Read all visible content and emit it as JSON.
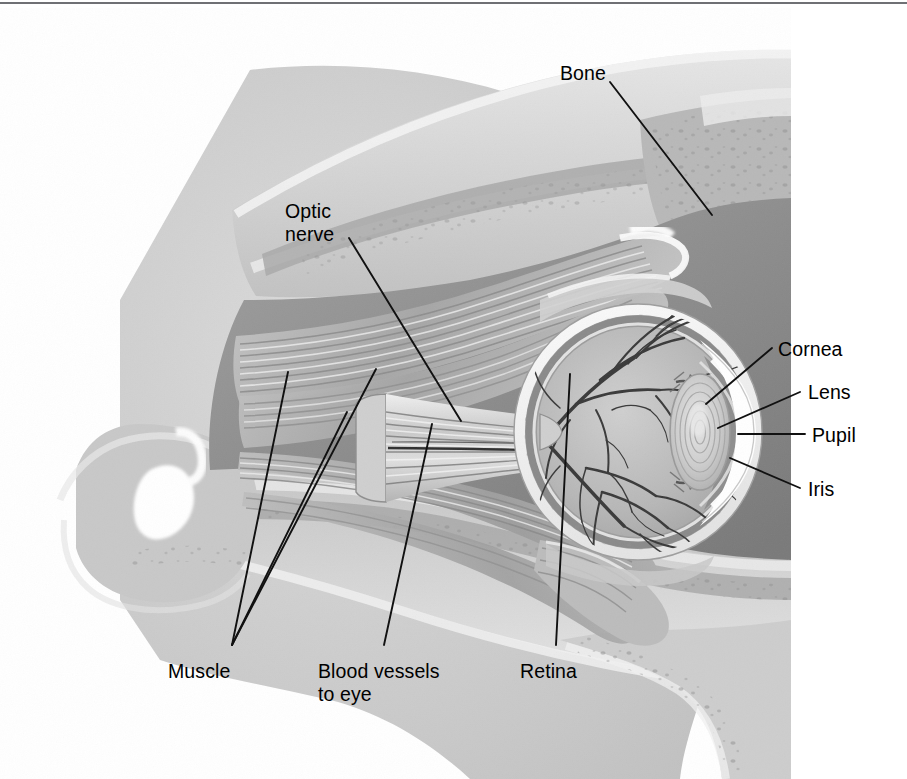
{
  "figure": {
    "kind": "anatomical-illustration",
    "palette": {
      "background": "#ffffff",
      "border_line": "#6f7074",
      "leader_line": "#111111",
      "label_text": "#000000",
      "bone_light": "#d8d8d8",
      "bone_mid": "#bdbdbd",
      "bone_dark": "#9a9a9a",
      "cavity_dark": "#6e6e6e",
      "orbit_fat": "#8f8f8f",
      "muscle_light": "#cfcfcf",
      "muscle_mid": "#a8a8a8",
      "sclera_white": "#f2f2f2",
      "vitreous": "#b9b9b9",
      "lens_fill": "#d4d4d4",
      "vessel": "#3a3a3a",
      "highlight": "#ffffff"
    }
  },
  "labels": [
    {
      "id": "bone",
      "text": "Bone",
      "x": 560,
      "y": 62,
      "lines": [
        "Bone"
      ]
    },
    {
      "id": "optic-nerve",
      "text": "Optic nerve",
      "x": 285,
      "y": 200,
      "lines": [
        "Optic",
        "nerve"
      ]
    },
    {
      "id": "cornea",
      "text": "Cornea",
      "x": 778,
      "y": 338,
      "lines": [
        "Cornea"
      ]
    },
    {
      "id": "lens",
      "text": "Lens",
      "x": 808,
      "y": 381,
      "lines": [
        "Lens"
      ]
    },
    {
      "id": "pupil",
      "text": "Pupil",
      "x": 812,
      "y": 424,
      "lines": [
        "Pupil"
      ]
    },
    {
      "id": "iris",
      "text": "Iris",
      "x": 808,
      "y": 478,
      "lines": [
        "Iris"
      ]
    },
    {
      "id": "muscle",
      "text": "Muscle",
      "x": 168,
      "y": 660,
      "lines": [
        "Muscle"
      ]
    },
    {
      "id": "blood-vessels",
      "text": "Blood vessels to eye",
      "x": 318,
      "y": 660,
      "lines": [
        "Blood vessels",
        "to eye"
      ]
    },
    {
      "id": "retina",
      "text": "Retina",
      "x": 520,
      "y": 660,
      "lines": [
        "Retina"
      ]
    }
  ],
  "leaders": [
    {
      "id": "bone",
      "points": "610,82 712,215"
    },
    {
      "id": "optic-nerve",
      "points": "349,238 461,421"
    },
    {
      "id": "cornea",
      "points": "772,348 706,404"
    },
    {
      "id": "lens",
      "points": "800,392 718,428"
    },
    {
      "id": "pupil",
      "points": "805,434 738,434"
    },
    {
      "id": "iris",
      "points": "800,488 730,458"
    },
    {
      "id": "muscle-1",
      "points": "232,645 288,372"
    },
    {
      "id": "muscle-2",
      "points": "232,645 347,412"
    },
    {
      "id": "muscle-3",
      "points": "232,645 376,369"
    },
    {
      "id": "blood-vessels",
      "points": "384,645 432,424"
    },
    {
      "id": "retina",
      "points": "556,645 570,374"
    }
  ]
}
